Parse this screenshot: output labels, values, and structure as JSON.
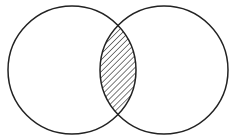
{
  "diagram": {
    "type": "venn",
    "sets": [
      {
        "name": "left-circle",
        "cx": 72,
        "cy": 70,
        "r": 64
      },
      {
        "name": "right-circle",
        "cx": 164,
        "cy": 70,
        "r": 64
      }
    ],
    "highlighted_region": "intersection",
    "fill_pattern": "diagonal-hatch",
    "stroke_color": "#222222",
    "background_color": "#ffffff"
  }
}
